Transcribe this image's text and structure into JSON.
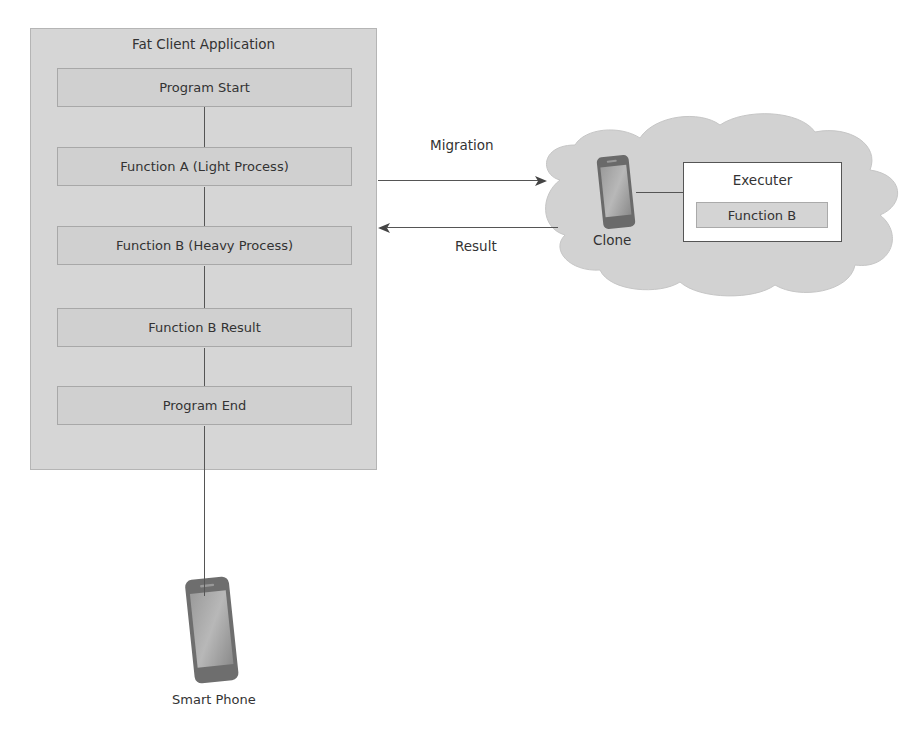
{
  "diagram": {
    "fat_client": {
      "title": "Fat Client Application",
      "steps": [
        {
          "label": "Program Start"
        },
        {
          "label": "Function A (Light Process)"
        },
        {
          "label": "Function B (Heavy Process)"
        },
        {
          "label": "Function B Result"
        },
        {
          "label": "Program End"
        }
      ]
    },
    "arrows": {
      "migration_label": "Migration",
      "result_label": "Result"
    },
    "cloud": {
      "clone_label": "Clone",
      "executer": {
        "title": "Executer",
        "function_label": "Function B"
      }
    },
    "device": {
      "label": "Smart Phone"
    },
    "icons": {
      "clone_phone": "smartphone-icon",
      "smart_phone": "smartphone-icon",
      "cloud": "cloud-shape"
    },
    "colors": {
      "container_fill": "#d6d6d6",
      "box_fill": "#d0d0d0",
      "cloud_fill": "#d2d2d2",
      "line": "#555555",
      "text": "#333333"
    }
  }
}
